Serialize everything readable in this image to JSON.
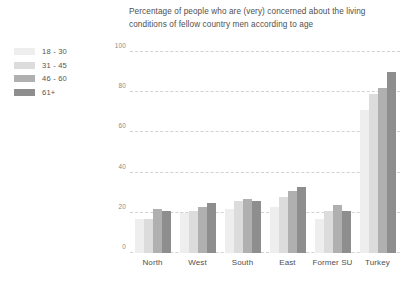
{
  "chart_data": {
    "type": "bar",
    "title": "Percentage of people who are (very) concerned about the living conditions of fellow country men according to age",
    "title_line_1": "Percentage of people who are (very) concerned about the living",
    "title_line_2": "conditions of fellow country men according to age",
    "xlabel": "",
    "ylabel": "",
    "ylim": [
      0,
      100
    ],
    "yticks": [
      0,
      20,
      40,
      60,
      80,
      100
    ],
    "ytick_labels": [
      "0",
      "20",
      "40",
      "60",
      "80",
      "100"
    ],
    "grid": "horizontal-dashed",
    "legend_position": "left",
    "categories": [
      "North",
      "West",
      "South",
      "East",
      "Former SU",
      "Turkey"
    ],
    "series": [
      {
        "name": "18 - 30",
        "color": "#eeeeee",
        "values": [
          17,
          20,
          22,
          23,
          17,
          71
        ]
      },
      {
        "name": "31 - 45",
        "color": "#dcdcdc",
        "values": [
          17,
          21,
          26,
          28,
          21,
          79
        ]
      },
      {
        "name": "46 - 60",
        "color": "#b0b0b0",
        "values": [
          22,
          23,
          27,
          31,
          24,
          82
        ]
      },
      {
        "name": "61+",
        "color": "#8e8e8e",
        "values": [
          21,
          25,
          26,
          33,
          21,
          90
        ]
      }
    ]
  },
  "legend": {
    "items": [
      {
        "label": "18 - 30",
        "color": "#eeeeee"
      },
      {
        "label": "31 - 45",
        "color": "#dcdcdc"
      },
      {
        "label": "46 - 60",
        "color": "#b0b0b0"
      },
      {
        "label": "61+",
        "color": "#8e8e8e"
      }
    ]
  },
  "colors": {
    "grid": "#d2d2d2",
    "tick_text": "#8a8a8a",
    "title_text": "#4f4f4f",
    "background": "#ffffff"
  }
}
